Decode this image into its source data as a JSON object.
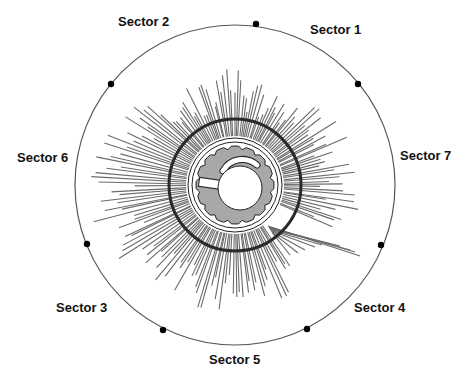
{
  "figure": {
    "center": [
      235,
      185
    ],
    "outer_radius": 160,
    "colors": {
      "ray": "#6a6a6a",
      "outer_circle": "#555555",
      "dark_ring": "#2a2a2a",
      "disc_fill": "#a8a8a8",
      "outline": "#222222",
      "dot": "#000000",
      "background": "#ffffff"
    },
    "dark_ring_radius": 66,
    "thin_ring_radii": [
      47,
      43
    ],
    "disc_radius": 39,
    "hole": {
      "cx": 240,
      "cy": 188,
      "r": 22
    }
  },
  "sectors": [
    {
      "label": "Sector 2",
      "x": 118,
      "y": 14
    },
    {
      "label": "Sector 1",
      "x": 310,
      "y": 22
    },
    {
      "label": "Sector 7",
      "x": 400,
      "y": 148
    },
    {
      "label": "Sector 6",
      "x": 17,
      "y": 150
    },
    {
      "label": "Sector 3",
      "x": 56,
      "y": 300
    },
    {
      "label": "Sector 4",
      "x": 354,
      "y": 300
    },
    {
      "label": "Sector 5",
      "x": 209,
      "y": 352
    }
  ],
  "dots": [
    {
      "x": 256,
      "y": 24
    },
    {
      "x": 358,
      "y": 84
    },
    {
      "x": 381,
      "y": 245
    },
    {
      "x": 307,
      "y": 329
    },
    {
      "x": 163,
      "y": 330
    },
    {
      "x": 87,
      "y": 244
    },
    {
      "x": 111,
      "y": 84
    }
  ],
  "rays": {
    "count": 180,
    "inner_radius": 48,
    "length_profile_deg": [
      [
        0,
        120
      ],
      [
        20,
        118
      ],
      [
        45,
        110
      ],
      [
        70,
        96
      ],
      [
        90,
        112
      ],
      [
        110,
        105
      ],
      [
        135,
        120
      ],
      [
        160,
        135
      ],
      [
        180,
        138
      ],
      [
        200,
        140
      ],
      [
        225,
        130
      ],
      [
        250,
        125
      ],
      [
        270,
        118
      ],
      [
        290,
        120
      ],
      [
        315,
        118
      ],
      [
        340,
        122
      ],
      [
        360,
        120
      ]
    ]
  },
  "bundle": {
    "from": [
      268,
      226
    ],
    "lines": [
      [
        360,
        256
      ],
      [
        355,
        252
      ],
      [
        350,
        250
      ],
      [
        340,
        246
      ],
      [
        330,
        244
      ],
      [
        322,
        245
      ],
      [
        315,
        247
      ],
      [
        305,
        250
      ],
      [
        298,
        253
      ],
      [
        290,
        255
      ]
    ]
  }
}
